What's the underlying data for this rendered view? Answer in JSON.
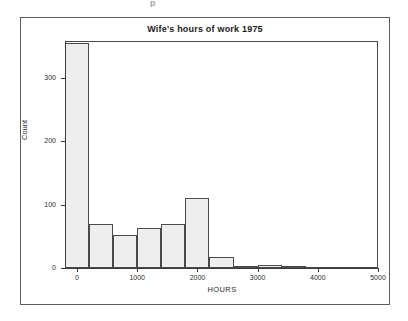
{
  "figure": {
    "top_sliver_text": "p",
    "x_axis_title": "HOURS",
    "y_axis_title": "Count"
  },
  "chart_data": {
    "type": "bar",
    "title": "Wife's hours of work 1975",
    "xlabel": "HOURS",
    "ylabel": "Count",
    "xlim": [
      -200,
      5000
    ],
    "ylim": [
      0,
      355
    ],
    "grid": false,
    "legend": null,
    "bin_width": 400,
    "bin_starts": [
      -200,
      200,
      600,
      1000,
      1400,
      1800,
      2200,
      2600,
      3000,
      3400,
      3800,
      4200,
      4600
    ],
    "categories": [
      "-200",
      "200",
      "600",
      "1000",
      "1400",
      "1800",
      "2200",
      "2600",
      "3000",
      "3400",
      "3800",
      "4200",
      "4600"
    ],
    "values": [
      355,
      70,
      52,
      63,
      70,
      110,
      18,
      3,
      5,
      3,
      0,
      1,
      1
    ],
    "xticks": [
      "0",
      "1000",
      "2000",
      "3000",
      "4000",
      "5000"
    ],
    "xtick_values": [
      0,
      1000,
      2000,
      3000,
      4000,
      5000
    ],
    "yticks": [
      "0",
      "100",
      "200",
      "300"
    ],
    "ytick_values": [
      0,
      100,
      200,
      300
    ],
    "bar_fill": "#eeeeee",
    "bar_stroke": "#4a4a4a"
  }
}
